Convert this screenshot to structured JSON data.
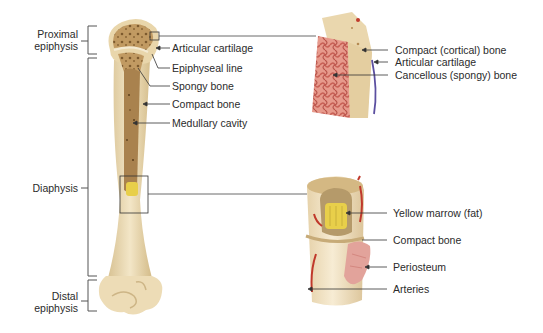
{
  "diagram": {
    "colors": {
      "bone_surface": "#ecdcb8",
      "bone_shade": "#d9c394",
      "spongy": "#b48a52",
      "medullary": "#a9824e",
      "cancellous_pink": "#d8756a",
      "marrow_yellow": "#e8cf4a",
      "artery_red": "#c0392b",
      "periosteum_pink": "#e2a39b",
      "cartilage_blue": "#5b4fa0",
      "leader": "#333333"
    },
    "region_labels": {
      "proximal_epiphysis": [
        "Proximal",
        "epiphysis"
      ],
      "diaphysis": "Diaphysis",
      "distal_epiphysis": [
        "Distal",
        "epiphysis"
      ]
    },
    "bone_labels": [
      "Articular cartilage",
      "Epiphyseal line",
      "Spongy bone",
      "Compact bone",
      "Medullary cavity"
    ],
    "upper_inset_labels": [
      "Compact (cortical) bone",
      "Articular cartilage",
      "Cancellous (spongy) bone"
    ],
    "lower_inset_labels": [
      "Yellow marrow (fat)",
      "Compact bone",
      "Periosteum",
      "Arteries"
    ]
  }
}
